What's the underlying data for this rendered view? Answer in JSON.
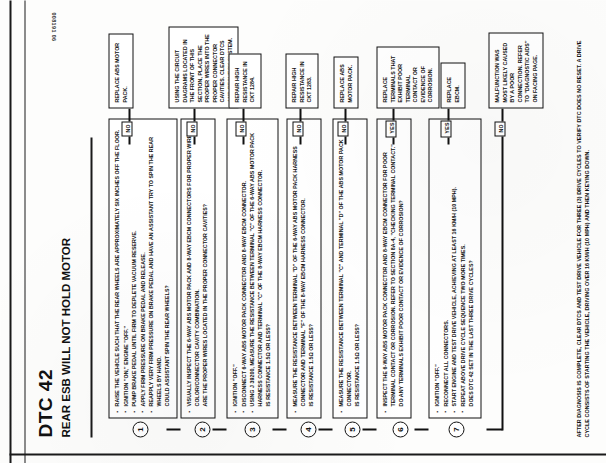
{
  "document": {
    "code": "DTC 42",
    "title": "REAR ESB WILL NOT HOLD MOTOR",
    "doc_id": "008191 06",
    "page_note": "AFTER DIAGNOSIS IS COMPLETE, CLEAR DTCs AND TEST DRIVE VEHICLE FOR THREE (3) DRIVE CYCLES TO VERIFY DTC DOES NO RESET.  A DRIVE CYCLE CONSISTS OF STARTING THE VEHICLE, DRIVING OVER 16 km/h (10 MPH) AND THEN KEYING DOWN."
  },
  "steps": [
    {
      "num": "1",
      "lines": [
        "RAISE THE VEHICLE SUCH THAT THE REAR WHEELS ARE APPROXIMATELY SIX INCHES OFF THE FLOOR.",
        "IGNITION \"ON,\" ENGINE \"OFF.\"",
        "PUMP BRAKE PEDAL UNTIL FIRM TO DEPLETE VACUUM RESERVE.",
        "APPLY FIRM PRESSURE ON BRAKE PEDAL AND RELEASE.",
        "REAPPLY VERY FIRM PRESSURE ON BRAKE PEDAL AND HAVE AN ASSISTANT TRY TO SPIN THE REAR WHEELS BY HAND.",
        "COULD ASSISTANT SPIN THE REAR WHEELS?"
      ],
      "answer": "NO",
      "result": "REPLACE ABS MOTOR PACK."
    },
    {
      "num": "2",
      "lines": [
        "VISUALLY INSPECT THE 6-WAY ABS MOTOR PACK AND 8-WAY EBCM CONNECTORS FOR PROPER WIRE COLOR/CONNECTOR CAVITY COMBINATION.",
        "ARE THE PROPER WIRES LOCATED IN THE PROPER CONNECTOR CAVITIES?"
      ],
      "answer": "NO",
      "result": "USING THE CIRCUIT DIAGRAMS LOCATED IN THE FRONT OF THIS SECTION, PLACE THE PROPER WIRES INTO THE PROPER CONNECTOR CAVITIES.  CLEAR DTCs AND RECHECK SYSTEM."
    },
    {
      "num": "3",
      "lines": [
        "IGNITION \"OFF.\"",
        "DISCONNECT 6-WAY ABS MOTOR PACK CONNECTOR AND 8-WAY EBCM CONNECTOR.",
        "USING J 39200, MEASURE THE RESISTANCE BETWEEN TERMINAL \"C\" OF THE 6-WAY ABS MOTOR PACK HARNESS CONNECTOR AND TERMINAL \"C\" OF THE 8-WAY EBCM HARNESS CONNECTOR.",
        "IS RESISTANCE 1.5Ω OR LESS?"
      ],
      "answer": "NO",
      "result": "REPAIR HIGH RESISTANCE IN CKT 1284."
    },
    {
      "num": "4",
      "lines": [
        "MEASURE THE RESISTANCE BETWEEN TERMINAL \"D\" OF THE 6-WAY ABS MOTOR PACK HARNESS CONNECTOR AND TERMINAL \"F\" OF THE 8-WAY EBCM HARNESS CONNECTOR.",
        "IS RESISTANCE 1.5Ω OR LESS?"
      ],
      "answer": "NO",
      "result": "REPAIR HIGH RESISTANCE IN CKT 1283."
    },
    {
      "num": "5",
      "lines": [
        "MEASURE THE RESISTANCE BETWEEN TERMINAL \"C\" AND TERMINAL \"D\" OF THE ABS MOTOR PACK CONNECTOR.",
        "IS RESISTANCE 1.5Ω OR LESS?"
      ],
      "answer": "NO",
      "result": "REPLACE ABS MOTOR PACK."
    },
    {
      "num": "6",
      "lines": [
        "INSPECT THE 6-WAY ABS MOTOR PACK CONNECTOR AND 8-WAY EBCM CONNECTOR FOR POOR TERMINAL CONTACT OR CORROSION. REFER TO SECTION 8A-4, \"CHECKING TERMINAL CONTACT.\"",
        "DO ANY TERMINALS EXHIBIT POOR CONTACT OR EVIDENCE OF CORROSION?"
      ],
      "answer": "YES",
      "result": "REPLACE TERMINALS THAT EXHIBIT POOR TERMINAL CONTACT OR EVIDENCE OF CORROSION."
    },
    {
      "num": "7",
      "lines": [
        "IGNITION \"OFF.\"",
        "RECONNECT ALL CONNECTORS.",
        "START ENGINE AND TEST DRIVE VEHICLE, ACHIEVING AT LEAST 16 km/h (10 MPH).",
        "REPEAT ABOVE DRIVE CYCLE SEQUENCE TWO MORE TIMES.",
        "DOES DTC 42 SET IN THE LAST THREE DRIVE CYCLES?"
      ],
      "answer": "YES",
      "result": "REPLACE EBCM."
    }
  ],
  "final": {
    "answer": "NO",
    "result": "MALFUNCTION WAS MOST LIKELY CAUSED BY A POOR CONNECTION. REFER TO \"DIAGNOSTIC AIDS\" ON FACING PAGE."
  }
}
